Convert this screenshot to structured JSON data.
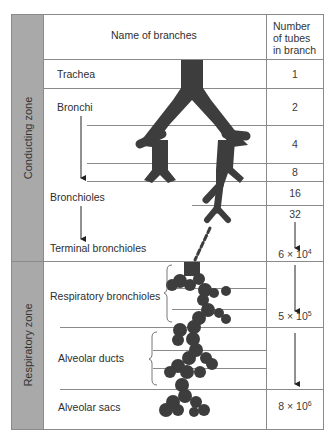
{
  "header": {
    "name_col": "Name of branches",
    "count_col_line1": "Number",
    "count_col_line2": "of tubes",
    "count_col_line3": "in branch"
  },
  "zones": [
    {
      "label": "Conducting zone"
    },
    {
      "label": "Respiratory zone"
    }
  ],
  "branches": [
    {
      "name": "Trachea"
    },
    {
      "name": "Bronchi"
    },
    {
      "name": "Bronchioles"
    },
    {
      "name": "Terminal bronchioles"
    },
    {
      "name": "Respiratory bronchioles"
    },
    {
      "name": "Alveolar ducts"
    },
    {
      "name": "Alveolar sacs"
    }
  ],
  "counts": [
    {
      "value": "1"
    },
    {
      "value": "2"
    },
    {
      "value": "4"
    },
    {
      "value": "8"
    },
    {
      "value": "16"
    },
    {
      "value": "32"
    },
    {
      "base": "6 × 10",
      "exp": "4"
    },
    {
      "base": "5 × 10",
      "exp": "5"
    },
    {
      "base": "8 × 10",
      "exp": "6"
    }
  ],
  "colors": {
    "zone_fill": "#a9a9a9",
    "airway_fill": "#3d3d3d",
    "rule_lines": "#8a8a8a"
  }
}
